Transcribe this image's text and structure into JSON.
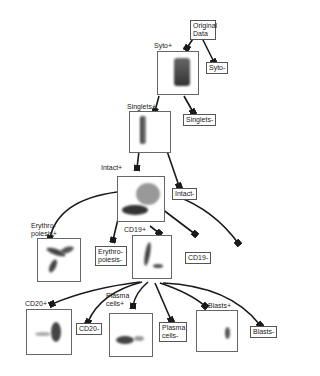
{
  "nodes": {
    "original_data": "Original Data",
    "syto_pos": "Syto+",
    "syto_neg": "Syto-",
    "singlets_pos": "Singlets+",
    "singlets_neg": "Singlets-",
    "intact_pos": "Intact+",
    "intact_neg": "Intact-",
    "erythropoiesis_pos": "Erythro-poiesis+",
    "erythropoiesis_neg": "Erythro-poiesis-",
    "cd19_pos": "CD19+",
    "cd19_neg": "CD19-",
    "cd20_pos": "CD20+",
    "cd20_neg": "CD20-",
    "plasma_pos": "Plasma cells+",
    "plasma_neg": "Plasma cells-",
    "blasts_pos": "Blasts+",
    "blasts_neg": "Blasts-"
  },
  "colors": {
    "arrow": "#1a1a1a",
    "box_border": "#555555",
    "density": "#333333"
  }
}
